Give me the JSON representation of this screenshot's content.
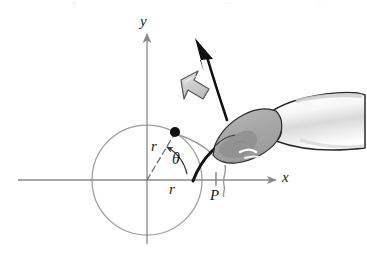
{
  "figure": {
    "title": "",
    "background_color": "#ffffff",
    "axis_color": "#8a8a8a",
    "circle_color": "#9a9a9a",
    "dot_color": "#111111",
    "hand_fill": "#a8a8a8",
    "hand_outline": "#2b2b2b",
    "cuff_fill": "#f2f2f2",
    "block_arrow_fill": "#cfcfcf",
    "block_arrow_outline": "#555555",
    "curved_arrow_color": "#111111",
    "string_color": "#111111"
  },
  "axes": {
    "x_label": "x",
    "y_label": "y",
    "origin": {
      "x": 147,
      "y": 180
    }
  },
  "circle": {
    "center": {
      "x": 147,
      "y": 180
    },
    "radius": 55,
    "label": "unit-circle"
  },
  "point_on_circle": {
    "name": "moving point",
    "x": 175,
    "y": 132
  },
  "labels": {
    "radius_dashed": "r",
    "radius_horizontal": "r",
    "angle": "θ",
    "point_p": "P"
  },
  "annotations": {
    "angle_arc_name": "theta-angle-arc",
    "dashed_radius_name": "dashed-radius-line",
    "string_name": "string-arc-from-p",
    "rotation_arrow_name": "counterclockwise-rotation-arrow",
    "block_arrow_name": "gray-block-arrow-direction"
  }
}
